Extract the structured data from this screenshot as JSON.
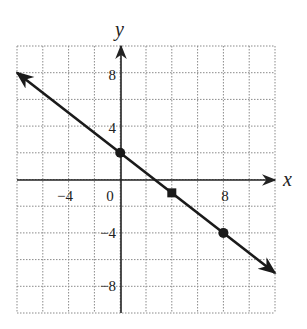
{
  "chart_data": {
    "type": "line",
    "title": "",
    "xlabel": "x",
    "ylabel": "y",
    "xlim": [
      -8,
      12
    ],
    "ylim": [
      -10,
      10
    ],
    "grid": true,
    "grid_step": 2,
    "x_ticks": [
      -4,
      0,
      8
    ],
    "x_tick_labels": [
      "−4",
      "0",
      "8"
    ],
    "y_ticks": [
      8,
      4,
      -4,
      -8
    ],
    "y_tick_labels": [
      "8",
      "4",
      "−4",
      "−8"
    ],
    "series": [
      {
        "name": "line",
        "equation": "y = -3/4 x + 2",
        "x": [
          -8,
          12
        ],
        "y": [
          8,
          -7
        ],
        "arrows": "both"
      }
    ],
    "points": [
      {
        "x": 0,
        "y": 2,
        "shape": "circle"
      },
      {
        "x": 4,
        "y": -1,
        "shape": "square"
      },
      {
        "x": 8,
        "y": -4,
        "shape": "circle"
      }
    ],
    "legend": null
  },
  "labels": {
    "x_axis": "x",
    "y_axis": "y",
    "xt_m4": "−4",
    "xt_0": "0",
    "xt_8": "8",
    "yt_8": "8",
    "yt_4": "4",
    "yt_m4": "−4",
    "yt_m8": "−8"
  },
  "colors": {
    "grid": "#8a8a8a",
    "axis": "#222222",
    "line": "#1a1a1a"
  }
}
